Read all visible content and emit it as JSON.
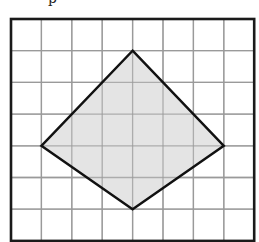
{
  "figure": {
    "top_fragment_text": "p",
    "grid": {
      "columns": 8,
      "rows": 7,
      "origin_px": [
        11,
        19
      ],
      "cell_w_px": 30.4,
      "cell_h_px": 31.7,
      "line_color": "#9a9a9a",
      "border_color": "#1a1a1a"
    },
    "shape": {
      "type": "quadrilateral",
      "vertices_grid": [
        [
          4,
          1
        ],
        [
          7,
          4
        ],
        [
          4,
          6
        ],
        [
          1,
          4
        ]
      ],
      "fill_color": "#e4e4e4",
      "stroke_color": "#111111",
      "stroke_width": 2.4
    }
  }
}
